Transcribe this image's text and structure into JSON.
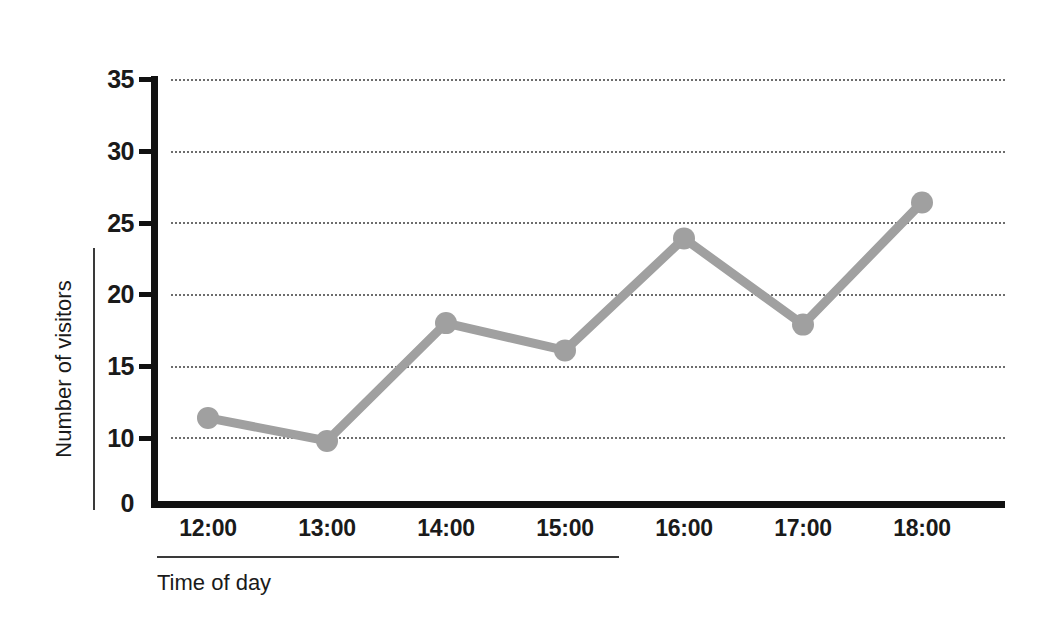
{
  "chart_data": {
    "type": "line",
    "title": "",
    "xlabel": "Time of day",
    "ylabel": "Number of visitors",
    "categories": [
      "12:00",
      "13:00",
      "14:00",
      "15:00",
      "16:00",
      "17:00",
      "18:00"
    ],
    "series": [
      {
        "name": "Number of visitors",
        "values": [
          11.4,
          9.8,
          18.0,
          16.1,
          23.9,
          17.9,
          26.4
        ],
        "color": "#a0a0a0",
        "marker": "circle"
      }
    ],
    "ylim": [
      0,
      35
    ],
    "y_ticks": [
      0,
      10,
      15,
      20,
      25,
      30,
      35
    ],
    "y_tick_labels": [
      "0",
      "10",
      "15",
      "20",
      "25",
      "30",
      "35"
    ],
    "y_axis_break": true,
    "grid": true,
    "gridlines_at": [
      10,
      15,
      20,
      25,
      30,
      35
    ],
    "legend": "none",
    "legend_position": "none"
  },
  "axes": {
    "y_title": "Number of visitors",
    "x_title": "Time of day",
    "axis_color": "#111111",
    "grid_color": "#6d6d6d"
  }
}
